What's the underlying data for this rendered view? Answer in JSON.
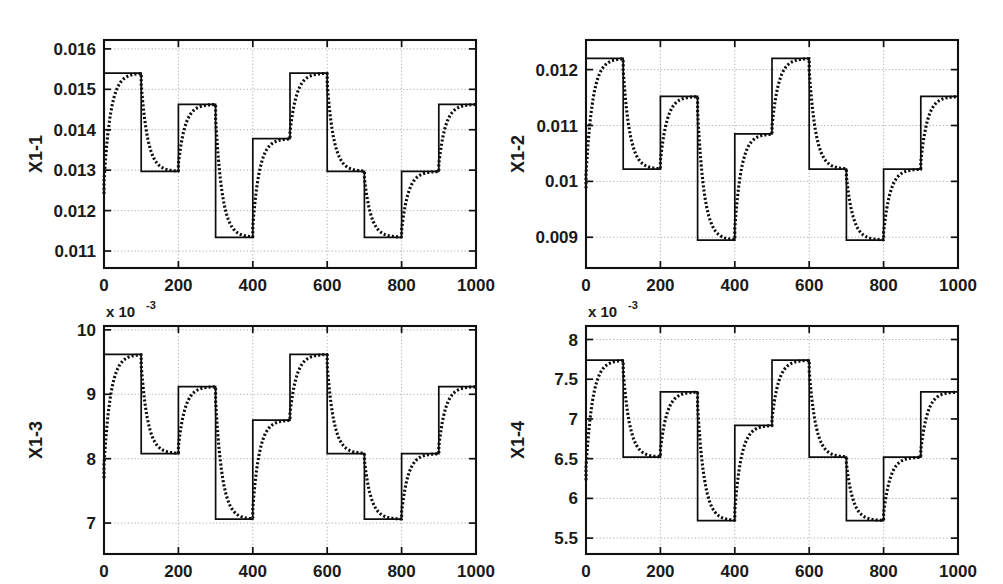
{
  "figure": {
    "title": "",
    "background": "#ffffff",
    "width": 1003,
    "height": 584,
    "layout": "2x2 subplot grid"
  },
  "colors": {
    "axis": "#111111",
    "grid": "#9a9a9a",
    "reference_series": "#0d0d0d",
    "response_series": "#0d0d0d"
  },
  "chart_data": [
    {
      "id": "x1-1",
      "type": "line",
      "title": "",
      "xlabel": "",
      "ylabel": "X1-1",
      "exponent_label": "",
      "y_scale": 1,
      "xlim": [
        0,
        1000
      ],
      "ylim": [
        0.01058,
        0.01622
      ],
      "xticks": [
        0,
        200,
        400,
        600,
        800,
        1000
      ],
      "xticklabels": [
        "0",
        "200",
        "400",
        "600",
        "800",
        "1000"
      ],
      "yticks": [
        0.011,
        0.012,
        0.013,
        0.014,
        0.015,
        0.016
      ],
      "yticklabels": [
        "0.011",
        "0.012",
        "0.013",
        "0.014",
        "0.015",
        "0.016"
      ],
      "grid": true,
      "legend": "none",
      "step_edges": [
        0,
        100,
        200,
        300,
        400,
        500,
        600,
        700,
        800,
        900,
        1000
      ],
      "series": [
        {
          "name": "reference",
          "style": "solid",
          "step_values": [
            0.0154,
            0.01297,
            0.01463,
            0.01134,
            0.01378,
            0.0154,
            0.01297,
            0.01134,
            0.01297,
            0.01463
          ]
        },
        {
          "name": "response",
          "style": "dotted",
          "lag_tau": 18,
          "step_values": [
            0.0154,
            0.01297,
            0.01463,
            0.01134,
            0.01378,
            0.0154,
            0.01297,
            0.01134,
            0.01297,
            0.01463
          ]
        }
      ]
    },
    {
      "id": "x1-2",
      "type": "line",
      "title": "",
      "xlabel": "",
      "ylabel": "X1-2",
      "exponent_label": "",
      "y_scale": 1,
      "xlim": [
        0,
        1000
      ],
      "ylim": [
        0.00845,
        0.01253
      ],
      "xticks": [
        0,
        200,
        400,
        600,
        800,
        1000
      ],
      "xticklabels": [
        "0",
        "200",
        "400",
        "600",
        "800",
        "1000"
      ],
      "yticks": [
        0.009,
        0.01,
        0.011,
        0.012
      ],
      "yticklabels": [
        "0.009",
        "0.01",
        "0.011",
        "0.012"
      ],
      "grid": true,
      "legend": "none",
      "step_edges": [
        0,
        100,
        200,
        300,
        400,
        500,
        600,
        700,
        800,
        900,
        1000
      ],
      "series": [
        {
          "name": "reference",
          "style": "solid",
          "step_values": [
            0.0122,
            0.01022,
            0.01152,
            0.00895,
            0.01085,
            0.0122,
            0.01022,
            0.00895,
            0.01022,
            0.01152
          ]
        },
        {
          "name": "response",
          "style": "dotted",
          "lag_tau": 18,
          "step_values": [
            0.0122,
            0.01022,
            0.01152,
            0.00895,
            0.01085,
            0.0122,
            0.01022,
            0.00895,
            0.01022,
            0.01152
          ]
        }
      ]
    },
    {
      "id": "x1-3",
      "type": "line",
      "title": "",
      "xlabel": "",
      "ylabel": "X1-3",
      "exponent_label": "x 10",
      "exponent_value": "-3",
      "y_scale": 0.001,
      "xlim": [
        0,
        1000
      ],
      "ylim": [
        6.52,
        10.06
      ],
      "xticks": [
        0,
        200,
        400,
        600,
        800,
        1000
      ],
      "xticklabels": [
        "0",
        "200",
        "400",
        "600",
        "800",
        "1000"
      ],
      "yticks": [
        7,
        8,
        9,
        10
      ],
      "yticklabels": [
        "7",
        "8",
        "9",
        "10"
      ],
      "grid": true,
      "legend": "none",
      "step_edges": [
        0,
        100,
        200,
        300,
        400,
        500,
        600,
        700,
        800,
        900,
        1000
      ],
      "series": [
        {
          "name": "reference",
          "style": "solid",
          "step_values": [
            9.62,
            8.08,
            9.12,
            7.06,
            8.6,
            9.62,
            8.08,
            7.06,
            8.08,
            9.12
          ]
        },
        {
          "name": "response",
          "style": "dotted",
          "lag_tau": 18,
          "step_values": [
            9.62,
            8.08,
            9.12,
            7.06,
            8.6,
            9.62,
            8.08,
            7.06,
            8.08,
            9.12
          ]
        }
      ]
    },
    {
      "id": "x1-4",
      "type": "line",
      "title": "",
      "xlabel": "",
      "ylabel": "X1-4",
      "exponent_label": "x 10",
      "exponent_value": "-3",
      "y_scale": 0.001,
      "xlim": [
        0,
        1000
      ],
      "ylim": [
        5.3,
        8.17
      ],
      "xticks": [
        0,
        200,
        400,
        600,
        800,
        1000
      ],
      "xticklabels": [
        "0",
        "200",
        "400",
        "600",
        "800",
        "1000"
      ],
      "yticks": [
        5.5,
        6,
        6.5,
        7,
        7.5,
        8
      ],
      "yticklabels": [
        "5.5",
        "6",
        "6.5",
        "7",
        "7.5",
        "8"
      ],
      "grid": true,
      "legend": "none",
      "step_edges": [
        0,
        100,
        200,
        300,
        400,
        500,
        600,
        700,
        800,
        900,
        1000
      ],
      "series": [
        {
          "name": "reference",
          "style": "solid",
          "step_values": [
            7.74,
            6.52,
            7.34,
            5.72,
            6.92,
            7.74,
            6.52,
            5.72,
            6.52,
            7.34
          ]
        },
        {
          "name": "response",
          "style": "dotted",
          "lag_tau": 18,
          "step_values": [
            7.74,
            6.52,
            7.34,
            5.72,
            6.92,
            7.74,
            6.52,
            5.72,
            6.52,
            7.34
          ]
        }
      ]
    }
  ]
}
